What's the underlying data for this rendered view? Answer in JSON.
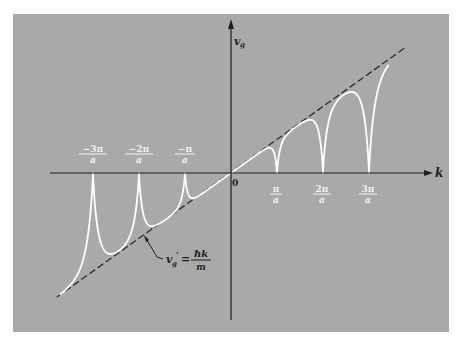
{
  "diagram": {
    "axes": {
      "x_label": "k",
      "y_label": "v",
      "y_label_sub": "g",
      "origin_label": "0"
    },
    "colors": {
      "background": "#a9a9a9",
      "page": "#ffffff",
      "axis": "#1e1e1e",
      "curve": "#ffffff",
      "dashed_line": "#2a2a2a",
      "positive_labels": "#f2f2f2",
      "negative_labels": "#f2f2f2"
    },
    "positive_ticks": [
      {
        "num": "π",
        "den": "a",
        "multiple": 1
      },
      {
        "num": "2π",
        "den": "a",
        "multiple": 2
      },
      {
        "num": "3π",
        "den": "a",
        "multiple": 3
      }
    ],
    "negative_ticks": [
      {
        "num": "−3π",
        "den": "a",
        "multiple": -3
      },
      {
        "num": "−2π",
        "den": "a",
        "multiple": -2
      },
      {
        "num": "−π",
        "den": "a",
        "multiple": -1
      }
    ],
    "free_electron_line": {
      "label_lhs": "v",
      "label_lhs_sub": "g",
      "label_prime": "'",
      "label_eq": "=",
      "label_num": "ħk",
      "label_den": "m"
    }
  },
  "chart_data": {
    "type": "line",
    "title": "",
    "xlabel": "k",
    "ylabel": "v_g",
    "x_ticks": [
      "-3π/a",
      "-2π/a",
      "-π/a",
      "0",
      "π/a",
      "2π/a",
      "3π/a"
    ],
    "x_range_units_pi_over_a": [
      -3.9,
      3.4
    ],
    "series": [
      {
        "name": "v_g' = ħk/m (free electron, dashed)",
        "style": "dashed",
        "x": [
          -3.8,
          3.8
        ],
        "y": [
          -3.8,
          3.8
        ]
      },
      {
        "name": "v_g (nearly free electron)",
        "style": "solid-white",
        "description": "follows ħk/m between zone boundaries; goes to 0 at k = nπ/a (n = ±1, ±2, ±3)",
        "zero_crossings": [
          -3,
          -2,
          -1,
          0,
          1,
          2,
          3
        ]
      }
    ],
    "grid": false,
    "legend": "none; inline annotation v_g' = ħk/m with leader line"
  }
}
